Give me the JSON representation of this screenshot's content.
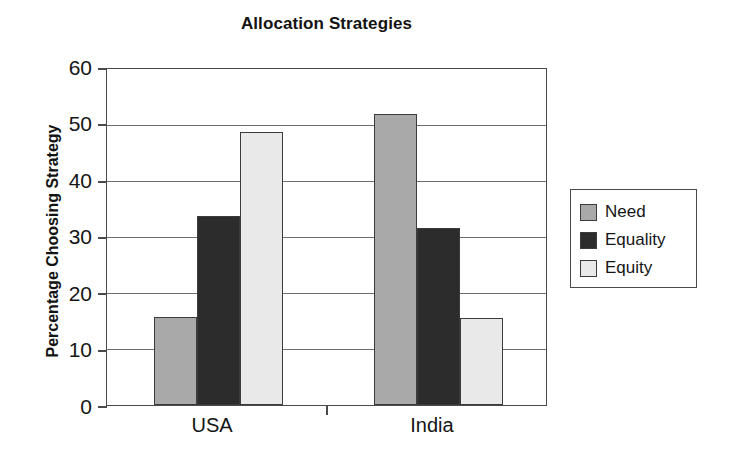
{
  "chart_data": {
    "type": "bar",
    "title": "Allocation Strategies",
    "xlabel": "",
    "ylabel": "Percentage Choosing Strategy",
    "categories": [
      "USA",
      "India"
    ],
    "series": [
      {
        "name": "Need",
        "values": [
          15.8,
          52.0
        ],
        "color": "#a9a9a9"
      },
      {
        "name": "Equality",
        "values": [
          33.7,
          31.6
        ],
        "color": "#2c2c2c"
      },
      {
        "name": "Equity",
        "values": [
          48.8,
          15.5
        ],
        "color": "#e9e9e9"
      }
    ],
    "ylim": [
      0,
      60
    ],
    "yticks": [
      0,
      10,
      20,
      30,
      40,
      50,
      60
    ],
    "ytick_labels": [
      "0",
      "10",
      "20",
      "30",
      "40",
      "50",
      "60"
    ],
    "grid": "horizontal",
    "legend_position": "right-outside"
  },
  "legend": {
    "items": [
      {
        "label": "Need"
      },
      {
        "label": "Equality"
      },
      {
        "label": "Equity"
      }
    ]
  },
  "axis": {
    "y_title": "Percentage Choosing Strategy",
    "tick_labels": [
      "60",
      "50",
      "40",
      "30",
      "20",
      "10",
      "0"
    ],
    "x_labels": [
      "USA",
      "India"
    ]
  }
}
